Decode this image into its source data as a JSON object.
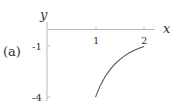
{
  "chart_data": {
    "type": "line",
    "panel_label": "(a)",
    "title": "",
    "xlabel": "x",
    "ylabel": "y",
    "x_ticks": [
      {
        "value": 1,
        "label": "1"
      },
      {
        "value": 2,
        "label": "2"
      }
    ],
    "y_ticks": [
      {
        "value": -1,
        "label": "-1"
      },
      {
        "value": -4,
        "label": "-4"
      }
    ],
    "xlim": [
      0,
      2.2
    ],
    "ylim": [
      -4.2,
      1
    ],
    "grid": false,
    "legend": null,
    "series": [
      {
        "name": "y = -4/x^2",
        "x": [
          1.0,
          1.1,
          1.2,
          1.3,
          1.4,
          1.5,
          1.6,
          1.7,
          1.8,
          1.9,
          2.0
        ],
        "y": [
          -4.0,
          -3.31,
          -2.78,
          -2.37,
          -2.04,
          -1.78,
          -1.56,
          -1.38,
          -1.23,
          -1.11,
          -1.0
        ]
      }
    ],
    "colors": {
      "axis": "#b0b0b0",
      "curve": "#555555",
      "text": "#333333"
    }
  }
}
